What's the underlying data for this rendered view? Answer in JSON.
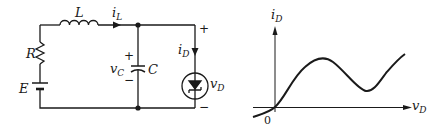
{
  "circuit": {
    "inductor_label": "L",
    "inductor_current": {
      "symbol": "i",
      "subscript": "L"
    },
    "resistor_label": "R",
    "source_label": "E",
    "capacitor_label": "C",
    "capacitor_voltage": {
      "symbol": "v",
      "subscript": "C",
      "plus": "+",
      "minus": "−"
    },
    "diode_current": {
      "symbol": "i",
      "subscript": "D"
    },
    "diode_voltage": {
      "symbol": "v",
      "subscript": "D",
      "plus": "+",
      "minus": "−"
    }
  },
  "graph": {
    "y_axis": {
      "symbol": "i",
      "subscript": "D"
    },
    "x_axis": {
      "symbol": "v",
      "subscript": "D"
    },
    "origin_label": "0"
  },
  "colors": {
    "ink": "#1a1a1a",
    "background": "#ffffff"
  }
}
